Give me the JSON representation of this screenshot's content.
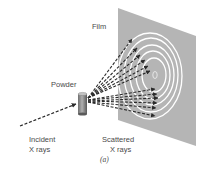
{
  "figure": {
    "caption": "(a)",
    "labels": {
      "film": "Film",
      "powder": "Powder",
      "incident_line1": "Incident",
      "incident_line2": "X rays",
      "scattered_line1": "Scattered",
      "scattered_line2": "X rays"
    },
    "colors": {
      "film": "#b3b3b3",
      "rings": "#ffffff",
      "rays": "#2a2a2a",
      "sample": "#8c8c8c",
      "text": "#4a4a4a"
    },
    "elements": [
      "film-plane",
      "diffraction-rings",
      "powder-sample",
      "incident-beam",
      "scattered-beams"
    ]
  }
}
